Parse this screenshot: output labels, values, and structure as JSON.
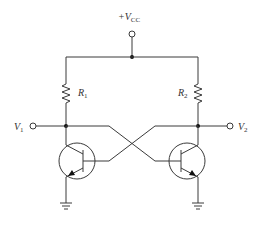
{
  "diagram": {
    "type": "circuit-schematic",
    "supply": {
      "prefix": "+V",
      "subscript": "CC"
    },
    "resistors": [
      {
        "name": "R",
        "subscript": "1"
      },
      {
        "name": "R",
        "subscript": "2"
      }
    ],
    "outputs": [
      {
        "name": "V",
        "subscript": "1"
      },
      {
        "name": "V",
        "subscript": "2"
      }
    ],
    "transistors": [
      {
        "id": "Q-left",
        "type": "NPN"
      },
      {
        "id": "Q-right",
        "type": "NPN"
      }
    ],
    "colors": {
      "wire": "#3a3a3a",
      "background": "#ffffff"
    }
  }
}
